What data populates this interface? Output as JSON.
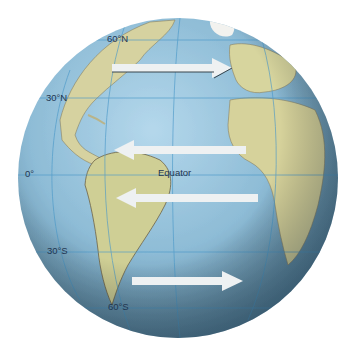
{
  "diagram": {
    "colors": {
      "ocean_light": "#a9cfe6",
      "ocean_dark": "#4f7c98",
      "land": "#d9d69a",
      "land_dark": "#8c8160",
      "grid": "#4a98c8",
      "arrow": "#eef1f2"
    },
    "latitude_labels": [
      {
        "text": "60°N",
        "x": 107,
        "y": 40
      },
      {
        "text": "30°N",
        "x": 46,
        "y": 99
      },
      {
        "text": "0°",
        "x": 25,
        "y": 175
      },
      {
        "text": "30°S",
        "x": 47,
        "y": 252
      },
      {
        "text": "60°S",
        "x": 108,
        "y": 308
      }
    ],
    "equator_label": {
      "text": "Equator",
      "x": 158,
      "y": 176
    },
    "arrows": [
      {
        "name": "westerlies-north",
        "direction": "east",
        "x1": 112,
        "x2": 232,
        "y": 68
      },
      {
        "name": "trade-winds-north",
        "direction": "west",
        "x1": 246,
        "x2": 114,
        "y": 150
      },
      {
        "name": "trade-winds-south",
        "direction": "west",
        "x1": 258,
        "x2": 116,
        "y": 198
      },
      {
        "name": "westerlies-south",
        "direction": "east",
        "x1": 132,
        "x2": 243,
        "y": 281
      }
    ]
  }
}
